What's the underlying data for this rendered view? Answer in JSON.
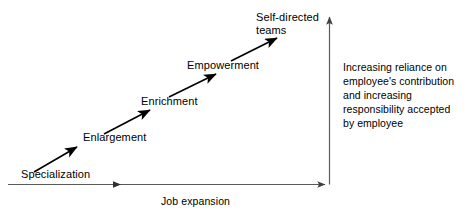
{
  "diagram": {
    "stages": [
      {
        "id": "specialization",
        "label": "Specialization"
      },
      {
        "id": "enlargement",
        "label": "Enlargement"
      },
      {
        "id": "enrichment",
        "label": "Enrichment"
      },
      {
        "id": "empowerment",
        "label": "Empowerment"
      },
      {
        "id": "self-directed-teams",
        "label_line1": "Self-directed",
        "label_line2": "teams"
      }
    ],
    "x_axis": {
      "label": "Job expansion"
    },
    "y_axis": {
      "note_lines": [
        "Increasing reliance on",
        "employee's contribution",
        "and increasing",
        "responsibility accepted",
        "by employee"
      ]
    },
    "colors": {
      "ink": "#000000",
      "axis": "#595959",
      "background": "#ffffff"
    }
  }
}
